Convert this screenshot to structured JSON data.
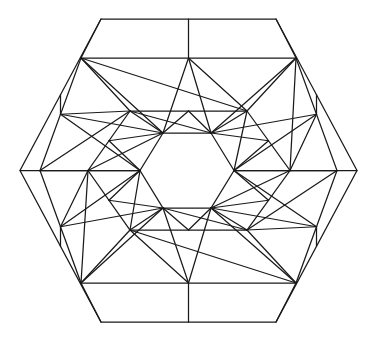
{
  "figure": {
    "type": "geometric-line-art",
    "background_color": "#ffffff",
    "stroke_color": "#1a1a1a",
    "stroke_width": 1.25,
    "symmetry": "6-fold dihedral (D6)",
    "canvas": {
      "width": 376,
      "height": 342
    },
    "center": {
      "x": 188,
      "y": 170.5
    }
  },
  "chart_data": {
    "type": "diagram",
    "rings": [
      {
        "name": "outer-hexagon",
        "role": "outer boundary",
        "points": [
          [
            101,
            19
          ],
          [
            276,
            19
          ],
          [
            357,
            170.5
          ],
          [
            276,
            322
          ],
          [
            101,
            322
          ],
          [
            20,
            170.5
          ]
        ]
      },
      {
        "name": "middle-hexagon",
        "role": "second ring band",
        "points": [
          [
            81,
            58
          ],
          [
            296,
            58
          ],
          [
            337,
            170.5
          ],
          [
            296,
            283
          ],
          [
            81,
            283
          ],
          [
            40,
            170.5
          ]
        ]
      },
      {
        "name": "inner-hexagon",
        "role": "third ring band",
        "points": [
          [
            130,
            111
          ],
          [
            247,
            111
          ],
          [
            290,
            170.5
          ],
          [
            247,
            230
          ],
          [
            130,
            230
          ],
          [
            88,
            170.5
          ]
        ]
      },
      {
        "name": "center-hexagon",
        "role": "central cell",
        "points": [
          [
            163,
            133
          ],
          [
            211,
            133
          ],
          [
            234,
            170.5
          ],
          [
            211,
            208
          ],
          [
            163,
            208
          ],
          [
            140,
            170.5
          ]
        ]
      }
    ],
    "hubs": {
      "description": "Six convergence vertices, the corners of the center hexagon; each emits a fan of rays",
      "points": [
        [
          163,
          133
        ],
        [
          211,
          133
        ],
        [
          234,
          170.5
        ],
        [
          211,
          208
        ],
        [
          163,
          208
        ],
        [
          140,
          170.5
        ]
      ]
    },
    "spoke_targets": {
      "description": "Endpoints on the outer and middle rings that the hub fans connect to",
      "outer_edge_midpoints": [
        [
          188,
          19
        ],
        [
          316,
          95
        ],
        [
          316,
          246
        ],
        [
          188,
          322
        ],
        [
          60,
          246
        ],
        [
          60,
          95
        ]
      ],
      "outer_vertices": [
        [
          101,
          19
        ],
        [
          276,
          19
        ],
        [
          357,
          170.5
        ],
        [
          276,
          322
        ],
        [
          101,
          322
        ],
        [
          20,
          170.5
        ]
      ]
    },
    "counts": {
      "rings": 4,
      "hub_vertices": 6,
      "fan_rays_per_hub": 5,
      "total_line_segments": 96
    },
    "grid": false,
    "legend": "none",
    "labels": []
  }
}
